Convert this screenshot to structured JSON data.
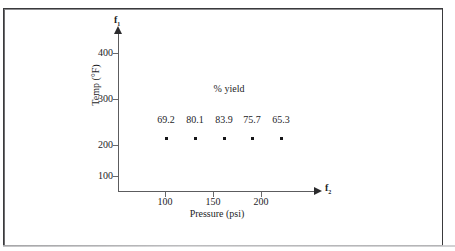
{
  "figure": {
    "background_color": "#ffffff",
    "frame_color": "#3a3a3c",
    "axis_color": "#5c5c5e",
    "text_color": "#1d1d1f",
    "marker_color": "#161618"
  },
  "axes": {
    "y_end_label": "f",
    "y_end_label_sub": "1",
    "x_end_label": "f",
    "x_end_label_sub": "2",
    "y_title": "Temp (°F)",
    "x_title": "Pressure (psi)",
    "y_ticks": [
      "400",
      "300",
      "200",
      "100"
    ],
    "x_ticks": [
      "100",
      "150",
      "200"
    ]
  },
  "annotation": {
    "series_label": "% yield"
  },
  "chart_data": {
    "type": "scatter",
    "title": "",
    "subtitle": "",
    "xlabel": "Pressure (psi)",
    "ylabel": "Temp (°F)",
    "xlim": [
      60,
      230
    ],
    "ylim": [
      60,
      430
    ],
    "xticks": [
      100,
      150,
      200
    ],
    "yticks": [
      100,
      200,
      300,
      400
    ],
    "grid": false,
    "legend": false,
    "annotations": [
      {
        "text": "% yield",
        "x": 148,
        "y": 300
      },
      {
        "text": "f",
        "sub": "1",
        "position": "y-axis-tip"
      },
      {
        "text": "f",
        "sub": "2",
        "position": "x-axis-tip"
      }
    ],
    "x": [
      100,
      120,
      150,
      170,
      200
    ],
    "y": [
      200,
      200,
      200,
      200,
      200
    ],
    "point_labels": [
      "69.2",
      "80.1",
      "83.9",
      "75.7",
      "65.3"
    ],
    "points": [
      {
        "pressure": 100,
        "temp": 200,
        "yield": 69.2
      },
      {
        "pressure": 120,
        "temp": 200,
        "yield": 80.1
      },
      {
        "pressure": 150,
        "temp": 200,
        "yield": 83.9
      },
      {
        "pressure": 170,
        "temp": 200,
        "yield": 75.7
      },
      {
        "pressure": 200,
        "temp": 200,
        "yield": 65.3
      }
    ],
    "series": [
      {
        "name": "% yield",
        "values": [
          69.2,
          80.1,
          83.9,
          75.7,
          65.3
        ]
      }
    ]
  },
  "geometry": {
    "y_tick_y": [
      53,
      99,
      145,
      176
    ],
    "x_tick_x": [
      165,
      213,
      261
    ],
    "point_px": [
      {
        "x": 166,
        "y": 138
      },
      {
        "x": 195,
        "y": 138
      },
      {
        "x": 224,
        "y": 138
      },
      {
        "x": 252,
        "y": 138
      },
      {
        "x": 281,
        "y": 138
      }
    ],
    "label_y": 114,
    "annotation_x": 229
  }
}
